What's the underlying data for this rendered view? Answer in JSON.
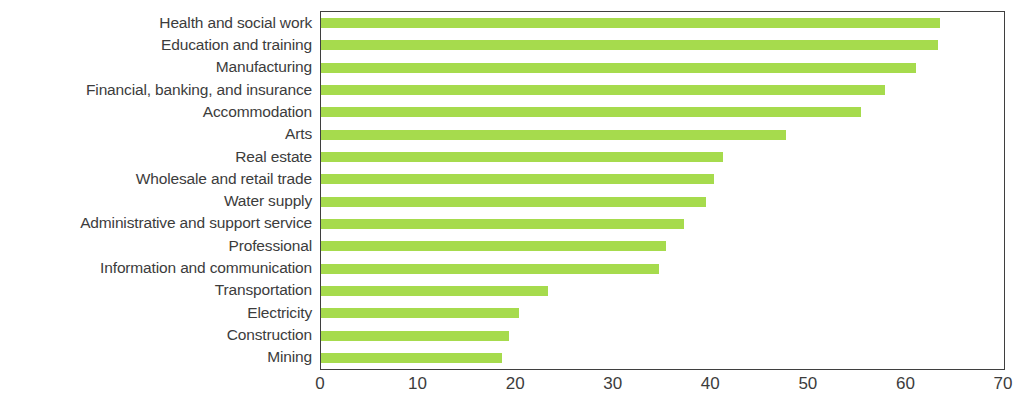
{
  "chart_data": {
    "type": "bar",
    "orientation": "horizontal",
    "title": "",
    "subtitle": "",
    "xlabel": "",
    "ylabel": "",
    "xlim": [
      0,
      70
    ],
    "xticks": [
      "0",
      "10",
      "20",
      "30",
      "40",
      "50",
      "60",
      "70"
    ],
    "xtick_values": [
      0,
      10,
      20,
      30,
      40,
      50,
      60,
      70
    ],
    "grid": false,
    "legend": null,
    "bar_color": "#a6db4d",
    "axis_color": "#3f3f3f",
    "text_color": "#3c3c3c",
    "categories": [
      "Health and social work",
      "Education and training",
      "Manufacturing",
      "Financial, banking, and insurance",
      "Accommodation",
      "Arts",
      "Real estate",
      "Wholesale and retail trade",
      "Water supply",
      "Administrative and support service",
      "Professional",
      "Information and communication",
      "Transportation",
      "Electricity",
      "Construction",
      "Mining"
    ],
    "values": [
      63.4,
      63.2,
      61.0,
      57.8,
      55.3,
      47.7,
      41.2,
      40.3,
      39.5,
      37.2,
      35.4,
      34.6,
      23.3,
      20.3,
      19.3,
      18.6
    ]
  }
}
